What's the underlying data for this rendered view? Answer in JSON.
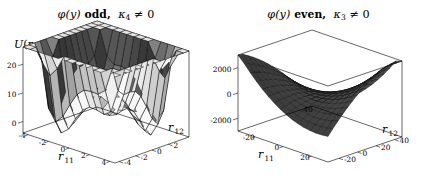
{
  "figure": {
    "width": 425,
    "height": 182,
    "background": "#ffffff"
  },
  "panels": [
    {
      "id": "left",
      "title_parts": {
        "phi": "φ",
        "arg": "(y)",
        "parity": "odd,",
        "kappa": "κ",
        "kappa_sub": "4",
        "relation": "≠ 0"
      },
      "title_plain": "φ(y) odd, κ₄ ≠ 0",
      "vertical_axis_label": "U(r₁₁, r₁₂)",
      "vertical_axis_parts": {
        "sym": "U",
        "open": "(",
        "r": "r",
        "s1": "11",
        "comma": ", ",
        "s2": "12",
        "close": ")"
      },
      "x_axis": {
        "name": "r",
        "sub": "11",
        "ticks": [
          -4,
          -2,
          0,
          2,
          4
        ],
        "labels": [
          "-4",
          "-2",
          "0",
          "2",
          "4"
        ]
      },
      "y_axis": {
        "name": "r",
        "sub": "12",
        "ticks": [
          -4,
          -2,
          0,
          2
        ],
        "labels": [
          "-4",
          "-2",
          "0",
          "2"
        ]
      },
      "z_axis": {
        "ticks": [
          0,
          10,
          20
        ],
        "labels": [
          "0",
          "10",
          "20"
        ]
      }
    },
    {
      "id": "right",
      "title_parts": {
        "phi": "φ",
        "arg": "(y)",
        "parity": "even,",
        "kappa": "κ",
        "kappa_sub": "3",
        "relation": "≠ 0"
      },
      "title_plain": "φ(y) even, κ₃ ≠ 0",
      "vertical_axis_label": "U(r₁₁, r₁₂)",
      "vertical_axis_parts": {
        "sym": "U",
        "open": "(",
        "r": "r",
        "s1": "11",
        "comma": ", ",
        "s2": "12",
        "close": ")"
      },
      "x_axis": {
        "name": "r",
        "sub": "11",
        "ticks": [
          -20,
          0,
          20
        ],
        "labels": [
          "-20",
          "0",
          "20"
        ]
      },
      "y_axis": {
        "name": "r",
        "sub": "12",
        "ticks": [
          -20,
          0,
          20,
          40
        ],
        "labels": [
          "-20",
          "0",
          "20",
          "40"
        ]
      },
      "y_axis_extra_label": "40",
      "z_axis": {
        "ticks": [
          -2000,
          0,
          2000
        ],
        "labels": [
          "-2000",
          "0",
          "2000"
        ]
      }
    }
  ],
  "chart_data": [
    {
      "type": "surface",
      "panel": "left",
      "title": "φ(y) odd, κ₄ ≠ 0",
      "zlabel": "U(r11, r12)",
      "xlabel": "r11",
      "ylabel": "r12",
      "xlim": [
        -4.5,
        4.5
      ],
      "ylim": [
        -4.5,
        4.5
      ],
      "zlim": [
        -4,
        26
      ],
      "xticks": [
        -4,
        -2,
        0,
        2,
        4
      ],
      "yticks": [
        -4,
        -2,
        0,
        2
      ],
      "zticks": [
        0,
        10,
        20
      ],
      "grid": true,
      "mesh_n": 13,
      "shading": "grayscale-facet",
      "description": "W-shaped double-well saddle potential; high ridges at the four corners, deep dark valley running diagonally through the centre",
      "formula": "U = 0.42*(x^2-4.6)^2*0.62 + 0.42*(y^2-4.6)^2*0.62 - 1.1*x*y",
      "z_range_observed": [
        -3,
        25
      ]
    },
    {
      "type": "surface",
      "panel": "right",
      "title": "φ(y) even, κ₃ ≠ 0",
      "zlabel": "U(r11, r12)",
      "xlabel": "r11",
      "ylabel": "r12",
      "xlim": [
        -32,
        32
      ],
      "ylim": [
        -32,
        48
      ],
      "zlim": [
        -3000,
        3000
      ],
      "xticks": [
        -20,
        0,
        20
      ],
      "yticks": [
        -20,
        0,
        20,
        40
      ],
      "zticks": [
        -2000,
        0,
        2000
      ],
      "grid": true,
      "mesh_n": 15,
      "shading": "dark-grayscale-facet",
      "description": "Broad dark curved trough; surface rises gently toward the far edges and sags along a shallow valley, mostly near z = 0 to 2000",
      "formula": "U = 1.3*x^2 - 0.45*y^2 + 2.0*x*y",
      "z_range_observed": [
        -2600,
        2600
      ]
    }
  ]
}
